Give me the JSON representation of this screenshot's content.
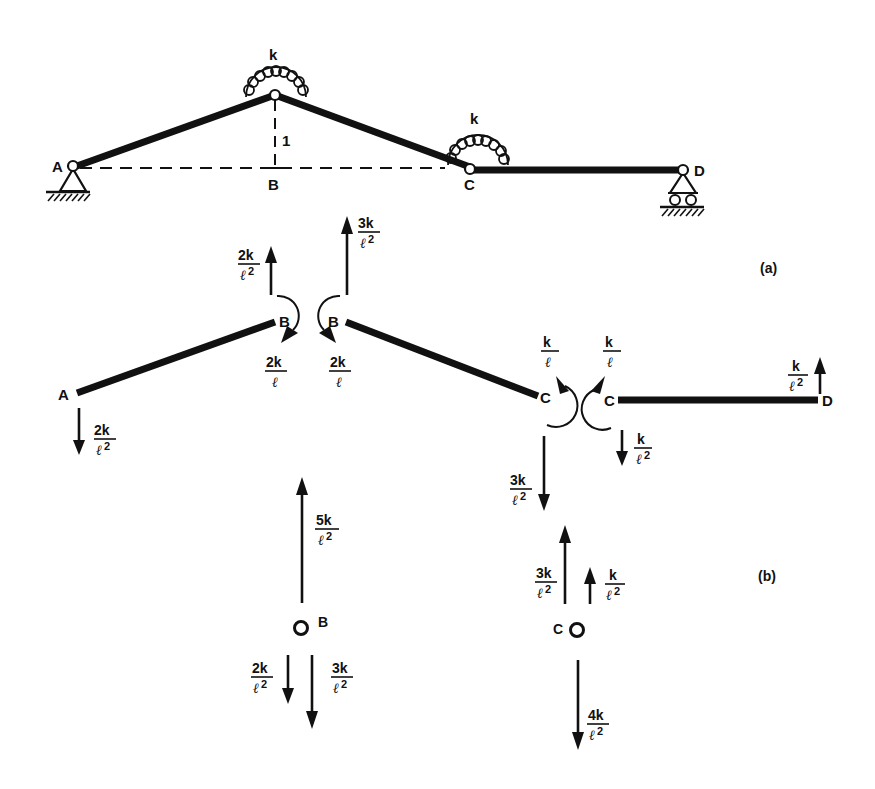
{
  "figure": {
    "panel_a_label": "(a)",
    "panel_b_label": "(b)"
  },
  "structure": {
    "nodes": {
      "A": "A",
      "B": "B",
      "C": "C",
      "D": "D"
    },
    "spring_label_B": "k",
    "spring_label_C": "k",
    "rise_label": "1",
    "supports": {
      "A": "pin support",
      "D": "roller support"
    }
  },
  "free_body": {
    "member_AB": {
      "A_label": "A",
      "B_label": "B",
      "A_force": {
        "num": "2k",
        "den": "ℓ",
        "exp": "2",
        "direction": "down"
      },
      "B_force": {
        "num": "2k",
        "den": "ℓ",
        "exp": "2",
        "direction": "up"
      },
      "B_moment": {
        "num": "2k",
        "den": "ℓ",
        "exp": "",
        "direction": "clockwise"
      }
    },
    "member_BC": {
      "B_label": "B",
      "C_label": "C",
      "B_force": {
        "num": "3k",
        "den": "ℓ",
        "exp": "2",
        "direction": "up"
      },
      "B_moment": {
        "num": "2k",
        "den": "ℓ",
        "exp": "",
        "direction": "counterclockwise"
      },
      "C_force": {
        "num": "3k",
        "den": "ℓ",
        "exp": "2",
        "direction": "down"
      },
      "C_moment": {
        "num": "k",
        "den": "ℓ",
        "exp": "",
        "direction": "counterclockwise"
      }
    },
    "member_CD": {
      "C_label": "C",
      "D_label": "D",
      "C_force": {
        "num": "k",
        "den": "ℓ",
        "exp": "2",
        "direction": "down"
      },
      "C_moment": {
        "num": "k",
        "den": "ℓ",
        "exp": "",
        "direction": "clockwise"
      },
      "D_force": {
        "num": "k",
        "den": "ℓ",
        "exp": "2",
        "direction": "up"
      }
    },
    "joint_B": {
      "label": "B",
      "forces": [
        {
          "num": "5k",
          "den": "ℓ",
          "exp": "2",
          "direction": "up"
        },
        {
          "num": "2k",
          "den": "ℓ",
          "exp": "2",
          "direction": "down"
        },
        {
          "num": "3k",
          "den": "ℓ",
          "exp": "2",
          "direction": "down"
        }
      ]
    },
    "joint_C": {
      "label": "C",
      "forces": [
        {
          "num": "3k",
          "den": "ℓ",
          "exp": "2",
          "direction": "up"
        },
        {
          "num": "k",
          "den": "ℓ",
          "exp": "2",
          "direction": "up"
        },
        {
          "num": "4k",
          "den": "ℓ",
          "exp": "2",
          "direction": "down"
        }
      ]
    }
  }
}
